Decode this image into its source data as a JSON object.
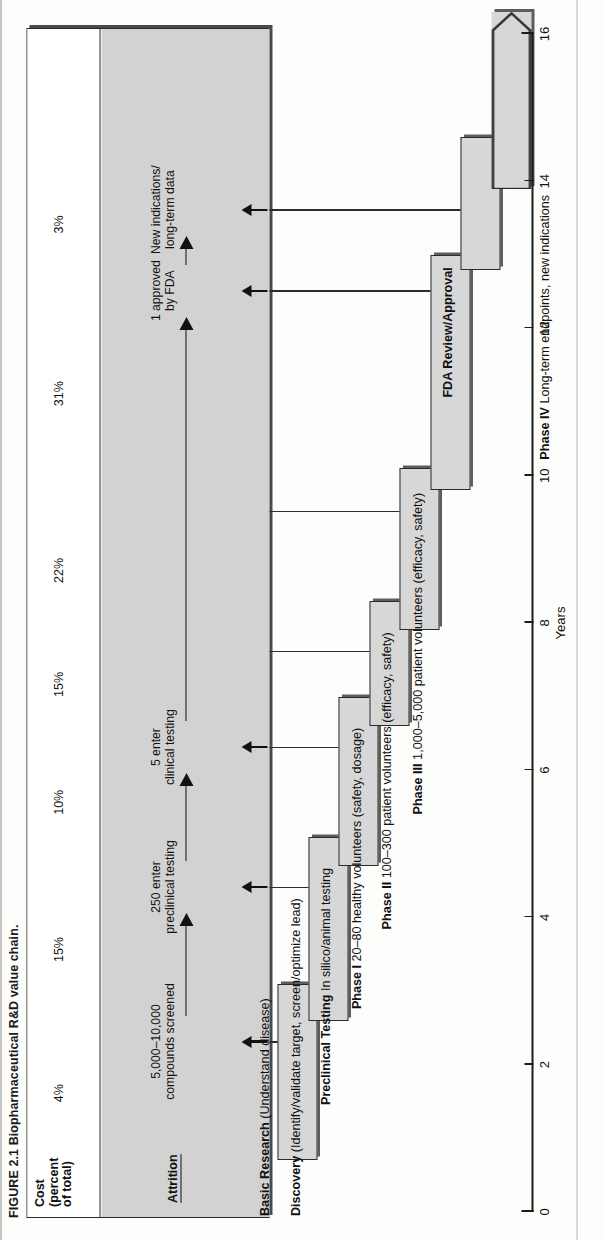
{
  "figure": {
    "number": "FIGURE 2.1",
    "caption": "Biopharmaceutical R&D value chain.",
    "full_caption": "FIGURE 2.1   Biopharmaceutical R&D value chain."
  },
  "panel": {
    "cost_header_line1": "Cost",
    "cost_header_line2": "(percent",
    "cost_header_line3": "of total)",
    "attrition_header": "Attrition"
  },
  "axis": {
    "title": "Years",
    "ticks": [
      0,
      2,
      4,
      6,
      8,
      10,
      12,
      14,
      16
    ],
    "min": 0,
    "max": 16
  },
  "chart_data": {
    "type": "bar",
    "title": "Biopharmaceutical R&D value chain",
    "xlabel": "Years",
    "ylabel": "",
    "xlim": [
      0,
      16
    ],
    "grid": false,
    "legend": "none",
    "orientation": "horizontal-gantt",
    "categories": [
      "Basic Research",
      "Discovery",
      "Preclinical Testing",
      "Phase I",
      "Phase II",
      "Phase III",
      "FDA Review/Approval",
      "Phase IV"
    ],
    "bars": [
      {
        "stage": "Basic Research",
        "start": 0.7,
        "end": 3.1,
        "cost_percent": 4,
        "open_ended": false
      },
      {
        "stage": "Discovery",
        "start": 2.6,
        "end": 5.1,
        "cost_percent": 15,
        "open_ended": false
      },
      {
        "stage": "Preclinical Testing",
        "start": 4.7,
        "end": 7.0,
        "cost_percent": 10,
        "open_ended": false
      },
      {
        "stage": "Phase I",
        "start": 6.6,
        "end": 8.3,
        "cost_percent": 15,
        "open_ended": false
      },
      {
        "stage": "Phase II",
        "start": 7.9,
        "end": 10.1,
        "cost_percent": 22,
        "open_ended": false
      },
      {
        "stage": "Phase III",
        "start": 9.8,
        "end": 13.0,
        "cost_percent": 31,
        "open_ended": false
      },
      {
        "stage": "FDA Review/Approval",
        "start": 12.8,
        "end": 14.6,
        "cost_percent": 3,
        "open_ended": false
      },
      {
        "stage": "Phase IV",
        "start": 13.9,
        "end": 16.3,
        "cost_percent": null,
        "open_ended": true
      }
    ],
    "cost_percent_labels": [
      "4%",
      "15%",
      "10%",
      "15%",
      "22%",
      "31%",
      "3%"
    ],
    "attrition_stages": [
      "5,000–10,000\ncompounds screened",
      "250 enter\npreclinical testing",
      "5 enter\nclinical testing",
      "1 approved\nby FDA",
      "New indications/\nlong-term data"
    ]
  },
  "cost_values": [
    {
      "label": "4%"
    },
    {
      "label": "15%"
    },
    {
      "label": "10%"
    },
    {
      "label": "15%"
    },
    {
      "label": "22%"
    },
    {
      "label": "31%"
    },
    {
      "label": "3%"
    }
  ],
  "attrition_notes": [
    {
      "text": "5,000–10,000\ncompounds screened"
    },
    {
      "text": "250 enter\npreclinical testing"
    },
    {
      "text": "5 enter\nclinical testing"
    },
    {
      "text": "1 approved\nby FDA"
    },
    {
      "text": "New indications/\nlong-term data"
    }
  ],
  "stage_labels": [
    {
      "bold": "Basic Research",
      "rest": " (Understand disease)"
    },
    {
      "bold": "Discovery",
      "rest": " (Identify/validate target, screen/optimize lead)"
    },
    {
      "bold": "Preclinical Testing",
      "rest": " In silico/animal testing"
    },
    {
      "bold": "Phase I",
      "rest": " 20–80 healthy volunteers (safety, dosage)"
    },
    {
      "bold": "Phase II",
      "rest": " 100–300 patient volunteers (efficacy, safety)"
    },
    {
      "bold": "Phase III",
      "rest": " 1,000–5,000 patient volunteers (efficacy, safety)"
    },
    {
      "bold": "FDA Review/Approval",
      "rest": ""
    },
    {
      "bold": "Phase IV",
      "rest": " Long-term endpoints, new indications"
    }
  ],
  "axis_tick_labels": [
    "0",
    "2",
    "4",
    "6",
    "8",
    "10",
    "12",
    "14",
    "16"
  ],
  "colors": {
    "bar_fill": "#d7d7d7",
    "bar_stroke": "#2b2b2b",
    "bar_shadow": "#5d5d5d",
    "attrition_band": "#d2d2d2",
    "ink": "#111111",
    "page": "#fdfdfc"
  }
}
